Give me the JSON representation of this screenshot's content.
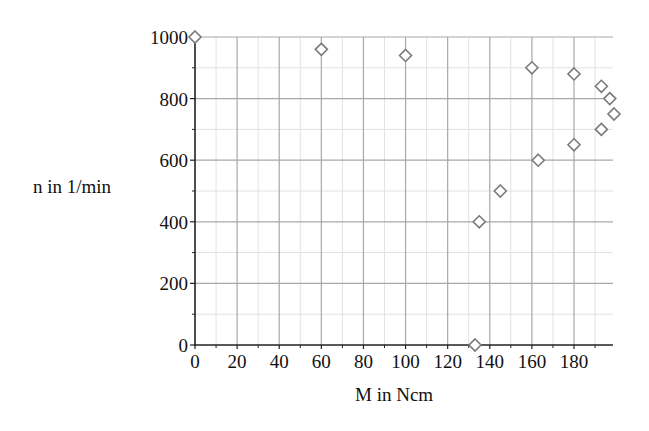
{
  "chart_data": {
    "type": "scatter",
    "title": "",
    "xlabel": "M in Ncm",
    "ylabel": "n in 1/min",
    "xlim": [
      0,
      198.5
    ],
    "ylim": [
      0,
      1000
    ],
    "x_ticks": [
      0,
      20,
      40,
      60,
      80,
      100,
      120,
      140,
      160,
      180
    ],
    "y_ticks": [
      0,
      200,
      400,
      600,
      800,
      1000
    ],
    "x_minor_step": 10,
    "y_minor_step": 100,
    "grid": true,
    "legend": null,
    "marker": "diamond-open",
    "marker_color": "#7a7a7a",
    "series": [
      {
        "name": "n(M)",
        "points": [
          {
            "x": 0,
            "y": 1000
          },
          {
            "x": 60,
            "y": 960
          },
          {
            "x": 100,
            "y": 940
          },
          {
            "x": 133,
            "y": 0
          },
          {
            "x": 135,
            "y": 400
          },
          {
            "x": 145,
            "y": 500
          },
          {
            "x": 160,
            "y": 900
          },
          {
            "x": 163,
            "y": 600
          },
          {
            "x": 180,
            "y": 880
          },
          {
            "x": 180,
            "y": 650
          },
          {
            "x": 193,
            "y": 840
          },
          {
            "x": 193,
            "y": 700
          },
          {
            "x": 197,
            "y": 800
          },
          {
            "x": 199,
            "y": 750
          }
        ]
      }
    ]
  },
  "labels": {
    "xlabel": "M in Ncm",
    "ylabel": "n in 1/min"
  },
  "colors": {
    "axis": "#222222",
    "major_grid": "#a8a8a8",
    "minor_grid": "#e2e2e2",
    "marker": "#7a7a7a"
  }
}
